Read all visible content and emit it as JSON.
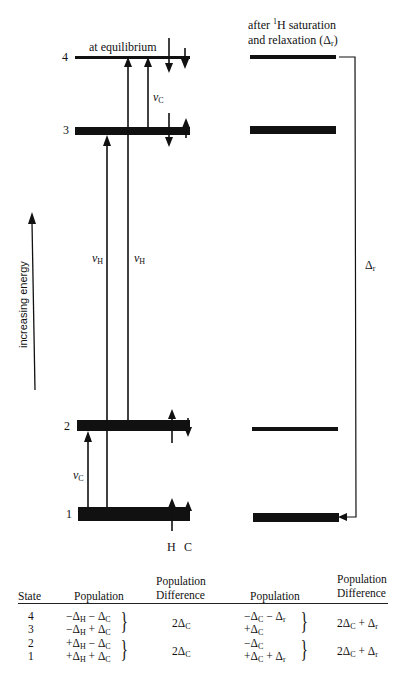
{
  "diagram": {
    "left_panel": {
      "title": "at equilibrium",
      "levels": [
        {
          "state": "4",
          "bar": "thin"
        },
        {
          "state": "3",
          "bar": "thick"
        },
        {
          "state": "2",
          "bar": "thick"
        },
        {
          "state": "1",
          "bar": "thick"
        }
      ],
      "transitions": [
        {
          "label": "ν",
          "sub": "C",
          "from": "3",
          "to": "4"
        },
        {
          "label": "ν",
          "sub": "H",
          "from": "1",
          "to": "3"
        },
        {
          "label": "ν",
          "sub": "H",
          "from": "2",
          "to": "4"
        },
        {
          "label": "ν",
          "sub": "C",
          "from": "1",
          "to": "2"
        }
      ],
      "spin_legend": {
        "h_label": "H",
        "c_label": "C"
      },
      "energy_axis_label": "increasing energy"
    },
    "right_panel": {
      "title_line1_pre": "after ",
      "title_line1_sup": "1",
      "title_line1_post": "H saturation",
      "title_line2": "and relaxation (Δ",
      "title_line2_sub": "r",
      "title_line2_end": ")",
      "levels": [
        {
          "state": "4",
          "bar": "thick"
        },
        {
          "state": "3",
          "bar": "thick"
        },
        {
          "state": "2",
          "bar": "thin"
        },
        {
          "state": "1",
          "bar": "thick"
        }
      ],
      "relaxation_label": "Δ",
      "relaxation_sub": "r"
    }
  },
  "table": {
    "headers": {
      "state": "State",
      "population": "Population",
      "pop_diff_line1": "Population",
      "pop_diff_line2": "Difference",
      "population2": "Population",
      "pop_diff2_line1": "Population",
      "pop_diff2_line2": "Difference"
    },
    "rows": [
      {
        "state": "4",
        "population": "−Δ_H − Δ_C",
        "population_after": "−Δ_C − Δ_r"
      },
      {
        "state": "3",
        "population": "−Δ_H + Δ_C",
        "population_after": "+Δ_C"
      },
      {
        "state": "2",
        "population": "+Δ_H − Δ_C",
        "population_after": "−Δ_C"
      },
      {
        "state": "1",
        "population": "+Δ_H + Δ_C",
        "population_after": "+Δ_C + Δ_r"
      }
    ],
    "groups": [
      {
        "states": [
          "4",
          "3"
        ],
        "difference": "2Δ_C",
        "difference_after": "2Δ_C + Δ_r"
      },
      {
        "states": [
          "2",
          "1"
        ],
        "difference": "2Δ_C",
        "difference_after": "2Δ_C + Δ_r"
      }
    ],
    "cells": {
      "r4_state": "4",
      "r3_state": "3",
      "r2_state": "2",
      "r1_state": "1",
      "pm_minus": "−",
      "pm_plus": "+",
      "delta": "Δ",
      "sub_H": "H",
      "sub_C": "C",
      "sub_r": "r",
      "two_delta": "2Δ"
    }
  }
}
